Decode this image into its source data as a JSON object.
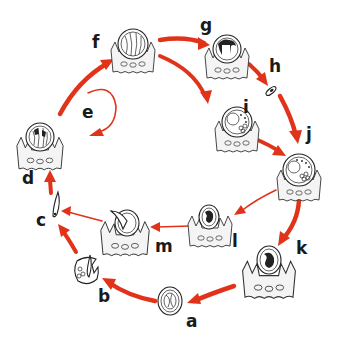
{
  "diagram": {
    "type": "life-cycle",
    "accent_color": "#e0331a",
    "label_color": "#1a1a1a",
    "stages": [
      {
        "id": "a",
        "label": "a",
        "description": "oocyst / spore (free)"
      },
      {
        "id": "b",
        "label": "b",
        "description": "hatching cyst releasing sporozoite"
      },
      {
        "id": "c",
        "label": "c",
        "description": "free sporozoite"
      },
      {
        "id": "d",
        "label": "d",
        "description": "intracellular stage in host epithelium"
      },
      {
        "id": "e",
        "label": "e",
        "description": "repeated cycle loop"
      },
      {
        "id": "f",
        "label": "f",
        "description": "schizont in host epithelium"
      },
      {
        "id": "g",
        "label": "g",
        "description": "merozoite release"
      },
      {
        "id": "h",
        "label": "h",
        "description": "free merozoite"
      },
      {
        "id": "i",
        "label": "i",
        "description": "developing gamont"
      },
      {
        "id": "j",
        "label": "j",
        "description": "gamont in host cell"
      },
      {
        "id": "k",
        "label": "k",
        "description": "zygote in host cell"
      },
      {
        "id": "l",
        "label": "l",
        "description": "cyst in host cell"
      },
      {
        "id": "m",
        "label": "m",
        "description": "sporozoite leaving cyst"
      }
    ],
    "edges": [
      {
        "from": "d",
        "to": "f",
        "weight": "thick"
      },
      {
        "from": "e",
        "to": "d",
        "weight": "thin"
      },
      {
        "from": "f",
        "to": "g",
        "weight": "thick"
      },
      {
        "from": "f",
        "to": "i",
        "weight": "thick"
      },
      {
        "from": "g",
        "to": "h",
        "weight": "thick"
      },
      {
        "from": "h",
        "to": "j",
        "weight": "thick"
      },
      {
        "from": "i",
        "to": "j",
        "weight": "thick"
      },
      {
        "from": "j",
        "to": "k",
        "weight": "thick"
      },
      {
        "from": "j",
        "to": "l",
        "weight": "thin"
      },
      {
        "from": "l",
        "to": "m",
        "weight": "thin"
      },
      {
        "from": "m",
        "to": "c",
        "weight": "thin"
      },
      {
        "from": "k",
        "to": "a",
        "weight": "thick"
      },
      {
        "from": "a",
        "to": "b",
        "weight": "thick"
      },
      {
        "from": "b",
        "to": "c",
        "weight": "thick"
      },
      {
        "from": "c",
        "to": "d",
        "weight": "thick"
      }
    ]
  }
}
